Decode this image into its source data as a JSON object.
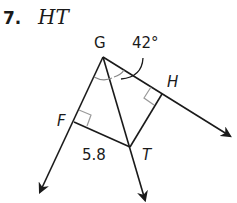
{
  "problem": {
    "number": "7.",
    "unknown": "HT"
  },
  "diagram": {
    "points": {
      "G": {
        "label": "G",
        "x": 103,
        "y": 57
      },
      "F": {
        "label": "F",
        "x": 74,
        "y": 122
      },
      "T": {
        "label": "T",
        "x": 130,
        "y": 147
      },
      "H": {
        "label": "H",
        "x": 162,
        "y": 94
      }
    },
    "angle_label": "42°",
    "length_label": "5.8",
    "colors": {
      "line": "#1a1a1a",
      "right_angle_mark": "#999999"
    }
  }
}
